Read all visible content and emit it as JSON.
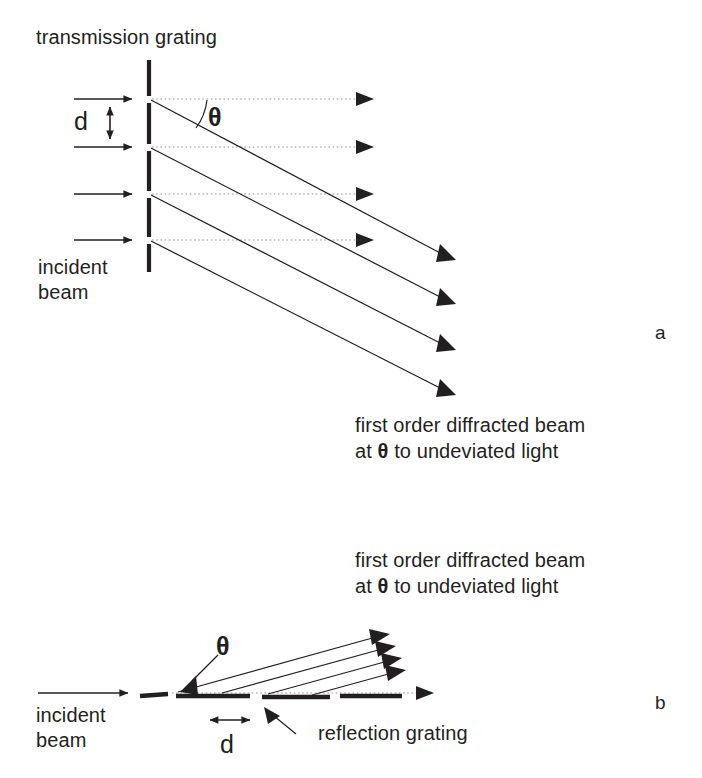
{
  "figure": {
    "caption_a_label": "a",
    "caption_b_label": "b",
    "stroke_color": "#231f20",
    "dotted_color": "#b9b9b9",
    "background": "#ffffff"
  },
  "panel_a": {
    "title": "transmission grating",
    "grating_name": "transmission-grating",
    "incident_label_line1": "incident",
    "incident_label_line2": "beam",
    "spacing_symbol": "d",
    "angle_symbol": "θ",
    "output_label_line1": "first order diffracted beam",
    "output_label_line2_before": "at ",
    "output_label_line2_theta": "θ",
    "output_label_line2_after": " to undeviated light",
    "beam_count": 4,
    "beam_y": [
      99,
      147,
      194,
      240
    ],
    "grating_x": 149,
    "undeviated_arrow_x": 372,
    "diffracted_end_x": 452,
    "diffracted_end_y": [
      255,
      299,
      345,
      390
    ]
  },
  "panel_b": {
    "output_label_line1": "first order diffracted beam",
    "output_label_line2_before": "at ",
    "output_label_line2_theta": "θ",
    "output_label_line2_after": " to undeviated light",
    "incident_label_line1": "incident",
    "incident_label_line2": "beam",
    "grating_label": "reflection grating",
    "spacing_symbol": "d",
    "angle_symbol": "θ",
    "grating_y": 694,
    "grating_start_x": 168,
    "grating_end_x": 332,
    "undeviated_arrow_x": 432,
    "beam_count": 4
  }
}
